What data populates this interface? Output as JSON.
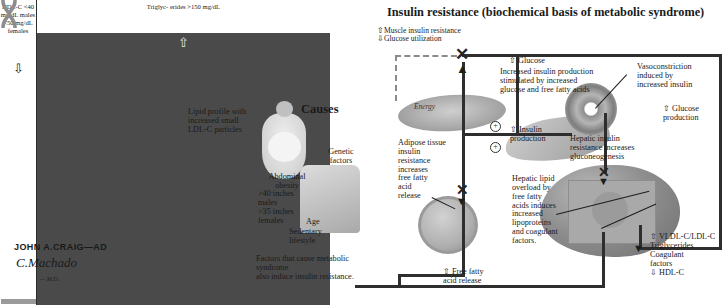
{
  "left_panel": {
    "features_title": "Features",
    "hypertension_label": "Hypertension\n≥130/85",
    "atherogenic_label": "Atherogenic\ndyslipidemia",
    "procoagulant_label": "Procoagulant\nstate",
    "glucose_intolerance_label": "Glucose intolerance\n(IGT or NIDDM)",
    "cluster_caption": "Cluster of CHD risk factors, most\nof which are of metabolic origin",
    "lipid_box": {
      "hdl_column": "HDL-C\n<40\nmg/dL\nmales\n<50\nmg/dL\nfemales",
      "hdl_arrow": "⇩",
      "tg_column": "Triglyc-\nerides\n>150\nmg/dL",
      "tg_arrow": "⇧"
    },
    "lipid_caption": "Lipid profile with\nincreased small\nLDL-C particles",
    "signature_line1": "JOHN A.CRAIG—AD",
    "signature_line2": "C.Machado",
    "signature_line3": "— M.D."
  },
  "causes_panel": {
    "title": "Causes",
    "genetic_label": "Genetic\nfactors",
    "abdominal_label": "Abdominal\nobesity",
    "obesity_measures": ">40 inches\nmales\n>35 inches\nfemales",
    "age_label": "Age",
    "sedentary_label": "Sedentary\nlifestyle",
    "caption": "Factors that cause metabolic syndrome\nalso induce insulin resistance."
  },
  "right_panel": {
    "title": "Insulin resistance (biochemical basis of metabolic syndrome)",
    "muscle_label": "⇧Muscle insulin resistance\n⇩Glucose utilization",
    "glucose_top_label": "⇧ Glucose",
    "insulin_production_stimulated": "Increased insulin production\nstimulated by increased\nglucose and free fatty acids",
    "vasoconstriction_label": "Vasoconstriction\ninduced by\nincreased insulin",
    "glucose_production_label": "⇧ Glucose\n   production",
    "energy_label": "Energy",
    "adipose_label": "Adipose tissue\ninsulin\nresistance\nincreases\nfree fatty\nacid\nrelease",
    "insulin_production_label": "⇧ Insulin\n  production",
    "hepatic_ir_label": "Hepatic insulin\nresistance increases\ngluconeogenesis",
    "hepatic_lipid_label": "Hepatic lipid\noverload by\nfree fatty\nacids induces\nincreased\nlipoproteins\nand coagulant\nfactors.",
    "ffa_release_label": "⇧ Free fatty\n   acid release",
    "vldl_label": "⇧ VLDL-C/LDL-C\n   Triglycerides\n   Coagulant\n   factors",
    "hdl_bottom_label": "⇩ HDL-C"
  },
  "colors": {
    "ink": "#1a1a1a",
    "arrow": "#2e2e2e",
    "fill_dark": "#4a4a4a",
    "paper": "#ffffff"
  }
}
